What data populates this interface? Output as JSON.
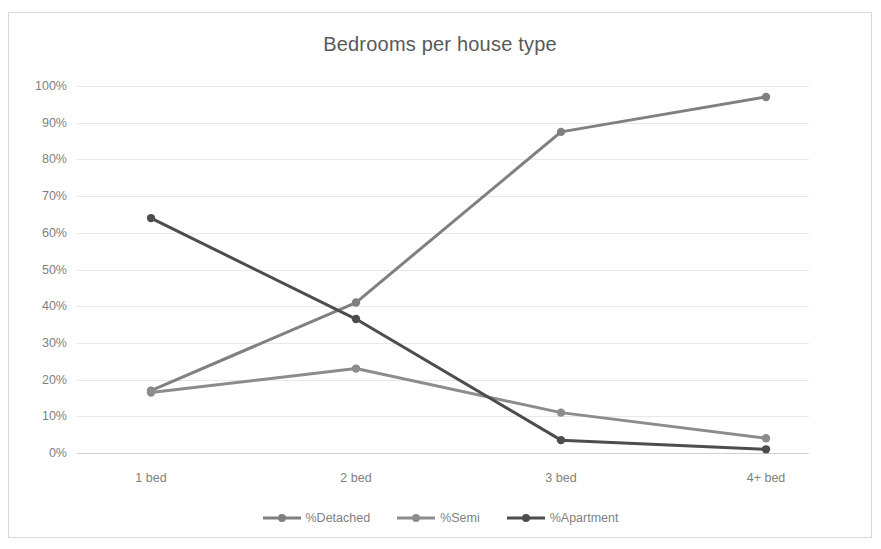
{
  "chart_data": {
    "type": "line",
    "title": "Bedrooms per house type",
    "xlabel": "",
    "ylabel": "",
    "categories": [
      "1 bed",
      "2 bed",
      "3 bed",
      "4+ bed"
    ],
    "ylim": [
      0,
      100
    ],
    "yticks": [
      "0%",
      "10%",
      "20%",
      "30%",
      "40%",
      "50%",
      "60%",
      "70%",
      "80%",
      "90%",
      "100%"
    ],
    "ytick_values": [
      0,
      10,
      20,
      30,
      40,
      50,
      60,
      70,
      80,
      90,
      100
    ],
    "grid": true,
    "legend_position": "bottom",
    "series": [
      {
        "name": "%Detached",
        "values": [
          17,
          41,
          87.5,
          97
        ],
        "color": "#808080"
      },
      {
        "name": "%Semi",
        "values": [
          16.5,
          23,
          11,
          4
        ],
        "color": "#8c8c8c"
      },
      {
        "name": "%Apartment",
        "values": [
          64,
          36.5,
          3.5,
          1
        ],
        "color": "#4d4d4d"
      }
    ]
  },
  "legend": {
    "items": [
      {
        "label": "%Detached"
      },
      {
        "label": "%Semi"
      },
      {
        "label": "%Apartment"
      }
    ]
  },
  "axis": {
    "y_labels": [
      "100%",
      "90%",
      "80%",
      "70%",
      "60%",
      "50%",
      "40%",
      "30%",
      "20%",
      "10%",
      "0%"
    ],
    "x_labels": [
      "1 bed",
      "2 bed",
      "3 bed",
      "4+ bed"
    ]
  }
}
